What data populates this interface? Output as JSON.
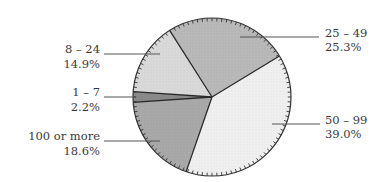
{
  "chart_data": {
    "type": "pie",
    "title": "",
    "start_angle_deg": 327.6,
    "direction": "clockwise",
    "slices": [
      {
        "label": "25 – 49",
        "pct_label": "25.3%",
        "value": 25.3,
        "color": "#b9b9b9"
      },
      {
        "label": "50 – 99",
        "pct_label": "39.0%",
        "value": 39.0,
        "color": "#f0f0f0"
      },
      {
        "label": "100 or more",
        "pct_label": "18.6%",
        "value": 18.6,
        "color": "#a9a9a9"
      },
      {
        "label": "1 – 7",
        "pct_label": "2.2%",
        "value": 2.2,
        "color": "#8a8a8a"
      },
      {
        "label": "8 – 24",
        "pct_label": "14.9%",
        "value": 14.9,
        "color": "#d9d9d9"
      }
    ],
    "legend": "none (leader-line labels)"
  },
  "layout": {
    "center": [
      212,
      97
    ],
    "radius": 79,
    "labels": [
      {
        "slice": 0,
        "side": "right",
        "line": [
          240,
          37,
          319,
          37
        ],
        "text_x": 325,
        "y1": 33,
        "y2": 47
      },
      {
        "slice": 1,
        "side": "right",
        "line": [
          272,
          124,
          320,
          124
        ],
        "text_x": 325,
        "y1": 120,
        "y2": 134
      },
      {
        "slice": 2,
        "side": "left",
        "line": [
          104,
          141,
          160,
          141
        ],
        "text_x": 100,
        "y1": 136,
        "y2": 151
      },
      {
        "slice": 3,
        "side": "left",
        "line": [
          104,
          97,
          136,
          97
        ],
        "text_x": 100,
        "y1": 92,
        "y2": 107
      },
      {
        "slice": 4,
        "side": "left",
        "line": [
          104,
          54,
          160,
          54
        ],
        "text_x": 100,
        "y1": 49,
        "y2": 64
      }
    ]
  }
}
